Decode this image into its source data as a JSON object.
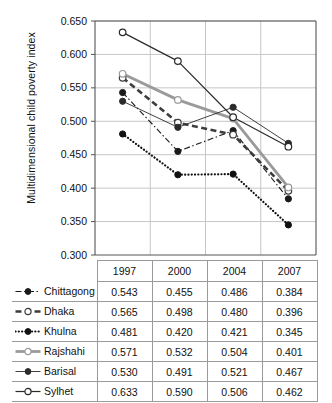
{
  "chart_data": {
    "type": "line",
    "title": "",
    "xlabel": "",
    "ylabel": "Multidimensional child poverty index",
    "categories": [
      "1997",
      "2000",
      "2004",
      "2007"
    ],
    "ylim": [
      0.3,
      0.65
    ],
    "ytick_labels": [
      "0.300",
      "0.350",
      "0.400",
      "0.450",
      "0.500",
      "0.550",
      "0.600",
      "0.650"
    ],
    "ytick_values": [
      0.3,
      0.35,
      0.4,
      0.45,
      0.5,
      0.55,
      0.6,
      0.65
    ],
    "grid": true,
    "legend_position": "table-below",
    "series": [
      {
        "name": "Chittagong",
        "values": [
          0.543,
          0.455,
          0.486,
          0.384
        ],
        "labels": [
          "0.543",
          "0.455",
          "0.486",
          "0.384"
        ],
        "color": "#1a1a1a",
        "line_style": "dash-dot",
        "marker": "filled-circle"
      },
      {
        "name": "Dhaka",
        "values": [
          0.565,
          0.498,
          0.48,
          0.396
        ],
        "labels": [
          "0.565",
          "0.498",
          "0.480",
          "0.396"
        ],
        "color": "#3d3d3d",
        "line_style": "thick-dash",
        "marker": "open-circle"
      },
      {
        "name": "Khulna",
        "values": [
          0.481,
          0.42,
          0.421,
          0.345
        ],
        "labels": [
          "0.481",
          "0.420",
          "0.421",
          "0.345"
        ],
        "color": "#111111",
        "line_style": "dotted",
        "marker": "filled-circle"
      },
      {
        "name": "Rajshahi",
        "values": [
          0.571,
          0.532,
          0.504,
          0.401
        ],
        "labels": [
          "0.571",
          "0.532",
          "0.504",
          "0.401"
        ],
        "color": "#9a9a9a",
        "line_style": "thick-solid",
        "marker": "open-circle"
      },
      {
        "name": "Barisal",
        "values": [
          0.53,
          0.491,
          0.521,
          0.467
        ],
        "labels": [
          "0.530",
          "0.491",
          "0.521",
          "0.467"
        ],
        "color": "#2b2b2b",
        "line_style": "thin-solid",
        "marker": "filled-circle"
      },
      {
        "name": "Sylhet",
        "values": [
          0.633,
          0.59,
          0.506,
          0.462
        ],
        "labels": [
          "0.633",
          "0.590",
          "0.506",
          "0.462"
        ],
        "color": "#2b2b2b",
        "line_style": "solid",
        "marker": "open-circle"
      }
    ]
  },
  "table": {
    "corner": "",
    "column_headers": [
      "1997",
      "2000",
      "2004",
      "2007"
    ],
    "rows": [
      {
        "name": "Chittagong",
        "cells": [
          "0.543",
          "0.455",
          "0.486",
          "0.384"
        ]
      },
      {
        "name": "Dhaka",
        "cells": [
          "0.565",
          "0.498",
          "0.480",
          "0.396"
        ]
      },
      {
        "name": "Khulna",
        "cells": [
          "0.481",
          "0.420",
          "0.421",
          "0.345"
        ]
      },
      {
        "name": "Rajshahi",
        "cells": [
          "0.571",
          "0.532",
          "0.504",
          "0.401"
        ]
      },
      {
        "name": "Barisal",
        "cells": [
          "0.530",
          "0.491",
          "0.521",
          "0.467"
        ]
      },
      {
        "name": "Sylhet",
        "cells": [
          "0.633",
          "0.590",
          "0.506",
          "0.462"
        ]
      }
    ]
  }
}
